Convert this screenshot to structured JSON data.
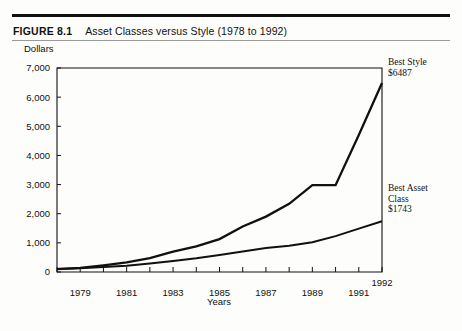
{
  "figure": {
    "number": "FIGURE 8.1",
    "caption": "Asset Classes versus Style (1978 to 1992)"
  },
  "chart_data": {
    "type": "line",
    "title": "Asset Classes versus Style (1978 to 1992)",
    "xlabel": "Years",
    "ylabel": "Dollars",
    "ylim": [
      0,
      7000
    ],
    "xlim": [
      1978,
      1992
    ],
    "grid": false,
    "legend_position": "right-annotations",
    "ytick_labels": [
      "0",
      "1,000",
      "2,000",
      "3,000",
      "4,000",
      "5,000",
      "6,000",
      "7,000"
    ],
    "yticks": [
      0,
      1000,
      2000,
      3000,
      4000,
      5000,
      6000,
      7000
    ],
    "xtick_labels": [
      "1979",
      "1981",
      "1983",
      "1985",
      "1987",
      "1989",
      "1991",
      "1992"
    ],
    "xticks_labeled": [
      1979,
      1981,
      1983,
      1985,
      1987,
      1989,
      1991,
      1992
    ],
    "x": [
      1978,
      1979,
      1980,
      1981,
      1982,
      1983,
      1984,
      1985,
      1986,
      1987,
      1988,
      1989,
      1990,
      1991,
      1992
    ],
    "series": [
      {
        "name": "Best Style",
        "end_label": "Best Style",
        "end_value_label": "$6487",
        "end_value": 6487,
        "values": [
          100,
          140,
          230,
          330,
          480,
          700,
          880,
          1130,
          1560,
          1900,
          2340,
          2980,
          2980,
          4700,
          6487
        ]
      },
      {
        "name": "Best Asset Class",
        "end_label": "Best Asset Class",
        "end_value_label": "$1743",
        "end_value": 1743,
        "values": [
          100,
          125,
          175,
          215,
          290,
          380,
          470,
          580,
          700,
          820,
          900,
          1020,
          1230,
          1490,
          1743
        ]
      }
    ]
  },
  "annotations": {
    "best_style": "Best Style\n$6487",
    "best_asset_class": "Best Asset\nClass\n$1743"
  },
  "colors": {
    "ink": "#111111",
    "paper": "#fdfdfc",
    "rule": "#3b3b3b"
  }
}
